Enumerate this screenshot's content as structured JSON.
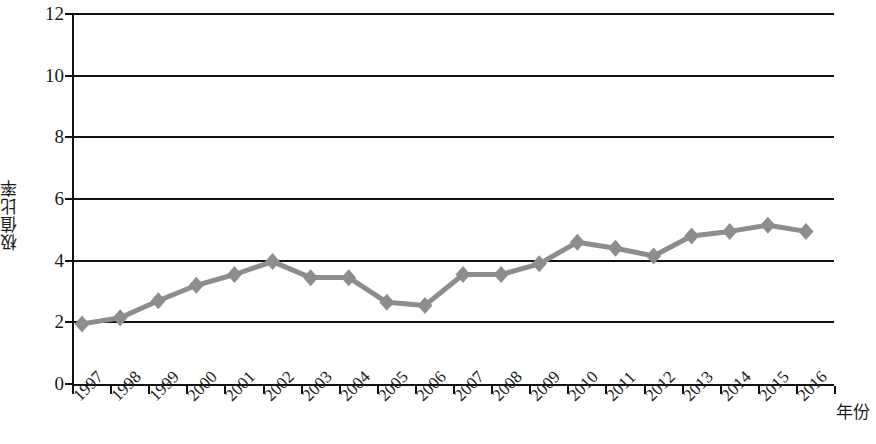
{
  "chart_data": {
    "type": "line",
    "title": "",
    "xlabel": "年份",
    "ylabel": "极值比率",
    "ylim": [
      0,
      12
    ],
    "y_ticks": [
      0,
      2,
      4,
      6,
      8,
      10,
      12
    ],
    "grid": true,
    "legend": "none",
    "series_color": "#8d8d8d",
    "axis_color": "#111111",
    "marker": "diamond",
    "categories": [
      "1997",
      "1998",
      "1999",
      "2000",
      "2001",
      "2002",
      "2003",
      "2004",
      "2005",
      "2006",
      "2007",
      "2008",
      "2009",
      "2010",
      "2011",
      "2012",
      "2013",
      "2014",
      "2015",
      "2016"
    ],
    "values": [
      1.95,
      2.15,
      2.7,
      3.2,
      3.55,
      3.97,
      3.45,
      3.45,
      2.65,
      2.55,
      3.55,
      3.55,
      3.9,
      4.6,
      4.4,
      4.15,
      4.8,
      4.95,
      5.15,
      4.95
    ],
    "series": [
      {
        "name": "极值比率",
        "values": [
          1.95,
          2.15,
          2.7,
          3.2,
          3.55,
          3.97,
          3.45,
          3.45,
          2.65,
          2.55,
          3.55,
          3.55,
          3.9,
          4.6,
          4.4,
          4.15,
          4.8,
          4.95,
          5.15,
          4.95
        ]
      }
    ]
  },
  "axes": {
    "y_title": "极值比率",
    "x_title": "年份",
    "y_tick_labels": [
      "12",
      "10",
      "8",
      "6",
      "4",
      "2",
      "0"
    ]
  }
}
